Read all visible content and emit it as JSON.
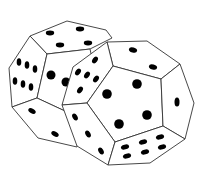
{
  "image": {
    "title": "Two dodecahedral dice",
    "description": "Black-and-white line drawing of two twelve-sided (dodecahedron) dice with black pips, the right die overlapping the left die",
    "background": "#ffffff",
    "line_color": "#333333",
    "pip_color": "#000000"
  },
  "dice": [
    {
      "name": "left-die",
      "visible_faces": [
        {
          "position": "top",
          "pips": 4
        },
        {
          "position": "left-upper",
          "pips": 6
        },
        {
          "position": "front",
          "pips": 2
        },
        {
          "position": "bottom-left",
          "pips": 2
        }
      ]
    },
    {
      "name": "right-die",
      "visible_faces": [
        {
          "position": "top",
          "pips": 2
        },
        {
          "position": "left-upper",
          "pips": 5
        },
        {
          "position": "front",
          "pips": 5
        },
        {
          "position": "right",
          "pips": 1
        },
        {
          "position": "bottom-left",
          "pips": 3
        },
        {
          "position": "bottom-right",
          "pips": 6
        }
      ]
    }
  ]
}
